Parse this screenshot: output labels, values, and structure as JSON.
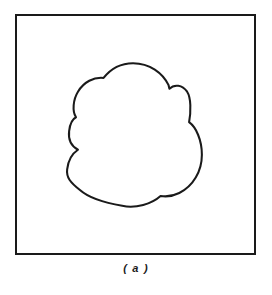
{
  "figure": {
    "caption": "( a )",
    "panel": {
      "frame_color": "#1a1a1a",
      "frame_width_px": 2,
      "background_color": "#ffffff",
      "x": 15,
      "y": 14,
      "width": 241,
      "height": 241
    },
    "shape": {
      "name": "cloud-blob-outline",
      "description": "Closed irregular cloud-like curve drawn with convex lobes separated by inward cusps",
      "stroke_color": "#1a1a1a",
      "fill_color": "#ffffff",
      "stroke_width_px": 2.1,
      "bounding_box": {
        "left": 66,
        "top": 62,
        "right": 203,
        "bottom": 207
      },
      "extreme_points": [
        {
          "label": "top-apex",
          "x": 133,
          "y": 62
        },
        {
          "label": "rightmost",
          "x": 203,
          "y": 155
        },
        {
          "label": "bottom",
          "x": 118,
          "y": 207
        },
        {
          "label": "leftmost",
          "x": 66,
          "y": 175
        }
      ],
      "cusps": [
        {
          "label": "upper-right-cusp",
          "x": 170,
          "y": 88
        },
        {
          "label": "right-mid-cusp",
          "x": 190,
          "y": 122
        },
        {
          "label": "lower-right-cusp",
          "x": 161,
          "y": 197
        },
        {
          "label": "left-lower-cusp",
          "x": 77,
          "y": 150
        },
        {
          "label": "left-upper-cusp",
          "x": 75,
          "y": 117
        }
      ],
      "path_d": "M 133 62 C 150 62 163 72 169 84 L 170 88 C 175 83 183 84 188 91 C 192 97 192 111 190 122 C 197 127 203 140 203 155 C 203 172 194 187 180 194 C 174 197 167 198 161 197 C 152 205 136 210 122 207 C 104 204 88 199 79 191 C 69 183 65 178 66 170 C 67 161 71 154 77 150 C 70 146 67 139 68 131 C 69 123 71 119 75 117 C 71 111 72 99 77 91 C 83 81 93 76 103 77 C 110 68 121 62 133 62 Z"
    }
  }
}
